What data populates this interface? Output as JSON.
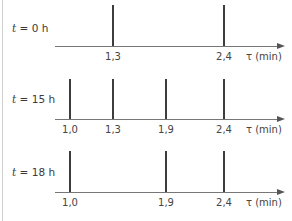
{
  "diagram": {
    "axis_label": "τ (min)",
    "rows": [
      {
        "time_label": "t",
        "time_value": " = 0 h",
        "peaks": [
          {
            "tau": 1.3,
            "label": "1,3"
          },
          {
            "tau": 2.4,
            "label": "2,4"
          }
        ]
      },
      {
        "time_label": "t",
        "time_value": " = 15 h",
        "peaks": [
          {
            "tau": 1.0,
            "label": "1,0"
          },
          {
            "tau": 1.3,
            "label": "1,3"
          },
          {
            "tau": 1.9,
            "label": "1,9"
          },
          {
            "tau": 2.4,
            "label": "2,4"
          }
        ]
      },
      {
        "time_label": "t",
        "time_value": " = 18 h",
        "peaks": [
          {
            "tau": 1.0,
            "label": "1,0"
          },
          {
            "tau": 1.9,
            "label": "1,9"
          },
          {
            "tau": 2.4,
            "label": "2,4"
          }
        ]
      }
    ],
    "colors": {
      "line": "#3d3d3d",
      "axis": "#777777",
      "frame": "#cfcfcf"
    }
  }
}
